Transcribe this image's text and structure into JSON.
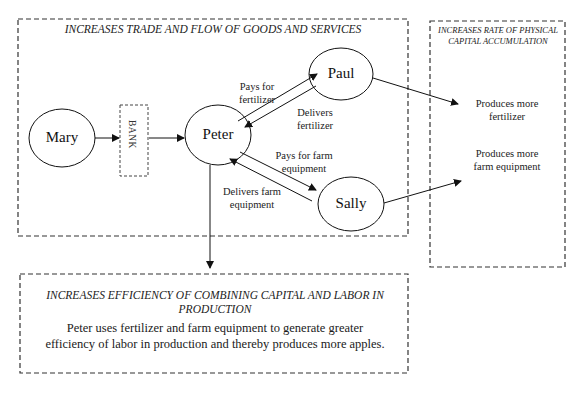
{
  "boxes": {
    "trade": {
      "title": "INCREASES TRADE AND FLOW OF GOODS AND SERVICES"
    },
    "capital": {
      "title_line1": "INCREASES RATE OF PHYSICAL",
      "title_line2": "CAPITAL ACCUMULATION"
    },
    "efficiency": {
      "title_line1": "INCREASES EFFICIENCY OF COMBINING CAPITAL AND LABOR IN",
      "title_line2": "PRODUCTION",
      "body_line1": "Peter uses fertilizer and farm equipment to generate greater",
      "body_line2": "efficiency of labor in production and thereby produces more apples."
    }
  },
  "nodes": {
    "mary": "Mary",
    "bank": "BANK",
    "peter": "Peter",
    "paul": "Paul",
    "sally": "Sally"
  },
  "edges": {
    "pays_fertilizer": {
      "line1": "Pays for",
      "line2": "fertilizer"
    },
    "delivers_fertilizer": {
      "line1": "Delivers",
      "line2": "fertilizer"
    },
    "pays_equipment": {
      "line1": "Pays for farm",
      "line2": "equipment"
    },
    "delivers_equipment": {
      "line1": "Delivers farm",
      "line2": "equipment"
    }
  },
  "outcomes": {
    "fertilizer": {
      "line1": "Produces more",
      "line2": "fertilizer"
    },
    "equipment": {
      "line1": "Produces more",
      "line2": "farm equipment"
    }
  },
  "colors": {
    "stroke": "#1a1a1a",
    "dash": "#333333"
  }
}
